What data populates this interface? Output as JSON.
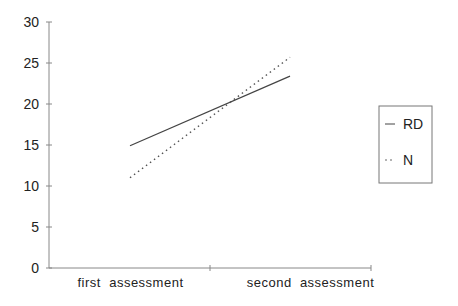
{
  "chart_data": {
    "type": "line",
    "title": "",
    "xlabel": "",
    "ylabel": "",
    "categories": [
      "first assessment",
      "second assessment"
    ],
    "series": [
      {
        "name": "RD",
        "style": "solid",
        "values": [
          14.9,
          23.4
        ]
      },
      {
        "name": "N",
        "style": "dotted",
        "values": [
          11.0,
          25.7
        ]
      }
    ],
    "ylim": [
      0,
      30
    ],
    "yticks": [
      "0",
      "5",
      "10",
      "15",
      "20",
      "25",
      "30"
    ],
    "grid": false,
    "legend_position": "right"
  },
  "legend": {
    "items": [
      {
        "label": "RD"
      },
      {
        "label": "N"
      }
    ]
  },
  "colors": {
    "line": "#444444",
    "axis": "#888888",
    "text": "#222222"
  }
}
